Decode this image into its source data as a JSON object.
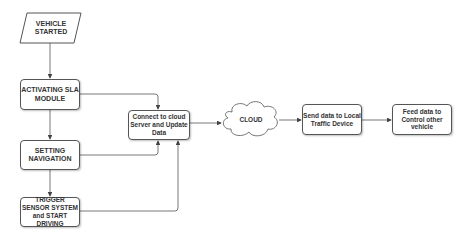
{
  "diagram": {
    "type": "flowchart",
    "nodes": {
      "vehicle_started": "VEHICLE STARTED",
      "activating_sla": "ACTIVATING SLA MODULE",
      "setting_navigation": "SETTING NAVIGATION",
      "trigger_sensor": "TRIGGER SENSOR SYSTEM and START DRIVING",
      "connect_cloud": "Connect to cloud Server and Update Data",
      "cloud": "CLOUD",
      "send_local": "Send data to Local Traffic Device",
      "feed_control": "Feed data to Control other vehicle"
    },
    "edges": [
      {
        "from": "VEHICLE STARTED",
        "to": "ACTIVATING SLA MODULE"
      },
      {
        "from": "ACTIVATING SLA MODULE",
        "to": "SETTING NAVIGATION"
      },
      {
        "from": "SETTING NAVIGATION",
        "to": "TRIGGER SENSOR SYSTEM and START DRIVING"
      },
      {
        "from": "ACTIVATING SLA MODULE",
        "to": "Connect to cloud Server and Update Data"
      },
      {
        "from": "SETTING NAVIGATION",
        "to": "Connect to cloud Server and Update Data"
      },
      {
        "from": "TRIGGER SENSOR SYSTEM and START DRIVING",
        "to": "Connect to cloud Server and Update Data"
      },
      {
        "from": "Connect to cloud Server and Update Data",
        "to": "CLOUD"
      },
      {
        "from": "CLOUD",
        "to": "Send data to Local Traffic Device"
      },
      {
        "from": "Send data to Local Traffic Device",
        "to": "Feed data to Control other vehicle"
      }
    ],
    "colors": {
      "stroke": "#555555",
      "text": "#333333",
      "background": "#ffffff"
    }
  }
}
